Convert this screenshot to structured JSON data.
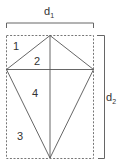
{
  "diagram": {
    "labels": {
      "d1": {
        "main": "d",
        "sub": "1"
      },
      "d2": {
        "main": "d",
        "sub": "2"
      },
      "regions": [
        "1",
        "2",
        "3",
        "4"
      ]
    },
    "colors": {
      "line": "#555555",
      "dashed": "#666666",
      "text": "#333333",
      "background": "#ffffff"
    }
  }
}
